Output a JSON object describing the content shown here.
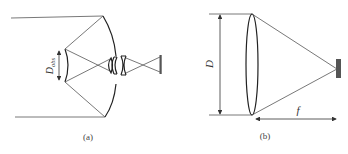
{
  "figure": {
    "panels": [
      {
        "id": "a",
        "caption": "(a)",
        "description": "Cassegrain reflecting telescope with corrector lens group and detector",
        "labels": {
          "obscuration_diameter": "D",
          "obscuration_subscript": "obs"
        },
        "components": [
          "primary-mirror",
          "secondary-mirror",
          "corrector-lens-group",
          "detector"
        ]
      },
      {
        "id": "b",
        "caption": "(b)",
        "description": "Refracting lens focusing onto detector",
        "labels": {
          "aperture_diameter": "D",
          "focal_length": "f"
        },
        "components": [
          "lens",
          "detector"
        ]
      }
    ],
    "colors": {
      "line": "#555555",
      "mirror": "#222222",
      "detector": "#555555",
      "background": "#ffffff"
    }
  }
}
